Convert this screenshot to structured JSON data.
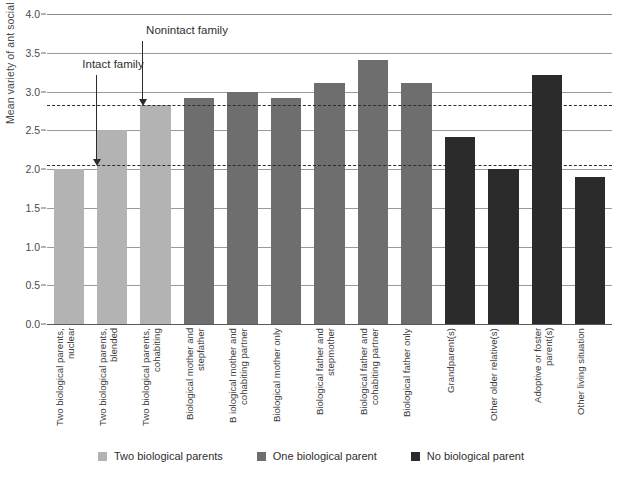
{
  "chart_data": {
    "type": "bar",
    "title": "",
    "xlabel": "",
    "ylabel": "Mean variety of ant social behavior",
    "ylim": [
      0.0,
      4.0
    ],
    "ytick_values": [
      0.0,
      0.5,
      1.0,
      1.5,
      2.0,
      2.5,
      3.0,
      3.5,
      4.0
    ],
    "ytick_labels": [
      "0.0",
      "0.5",
      "1.0",
      "1.5",
      "2.0",
      "2.5",
      "3.0",
      "3.5",
      "4.0"
    ],
    "grid": "horizontal",
    "legend_position": "bottom-center",
    "categories": [
      "Two biological parents, nuclear",
      "Two biological parents, blended",
      "Two biological parents, cohabiting",
      "Biological mother and stepfather",
      "B iological mother and cohabiting partner",
      "Biological mother only",
      "Biological father and stepmother",
      "Biological father and cohabiting partner",
      "Biological father only",
      "Grandparent(s)",
      "Other older relative(s)",
      "Adoptive or foster parent(s)",
      "Other living situation"
    ],
    "values": [
      2.0,
      2.5,
      2.83,
      2.91,
      3.0,
      2.91,
      3.11,
      3.41,
      3.11,
      2.41,
      2.0,
      3.21,
      1.9
    ],
    "groups": [
      "Two biological parents",
      "Two biological parents",
      "Two biological parents",
      "One biological parent",
      "One biological parent",
      "One biological parent",
      "One biological parent",
      "One biological parent",
      "One biological parent",
      "No biological parent",
      "No biological parent",
      "No biological parent",
      "No biological parent"
    ],
    "series": [
      {
        "name": "Two biological parents",
        "color": "#b3b3b3",
        "points": [
          {
            "category": "Two biological parents, nuclear",
            "value": 2.0
          },
          {
            "category": "Two biological parents, blended",
            "value": 2.5
          },
          {
            "category": "Two biological parents, cohabiting",
            "value": 2.83
          }
        ]
      },
      {
        "name": "One biological parent",
        "color": "#6e6e6e",
        "points": [
          {
            "category": "Biological mother and stepfather",
            "value": 2.91
          },
          {
            "category": "B iological mother and cohabiting partner",
            "value": 3.0
          },
          {
            "category": "Biological mother only",
            "value": 2.91
          },
          {
            "category": "Biological father and stepmother",
            "value": 3.11
          },
          {
            "category": "Biological father and cohabiting partner",
            "value": 3.41
          },
          {
            "category": "Biological father only",
            "value": 3.11
          }
        ]
      },
      {
        "name": "No biological parent",
        "color": "#2b2b2b",
        "points": [
          {
            "category": "Grandparent(s)",
            "value": 2.41
          },
          {
            "category": "Other older relative(s)",
            "value": 2.0
          },
          {
            "category": "Adoptive or foster parent(s)",
            "value": 3.21
          },
          {
            "category": "Other living situation",
            "value": 1.9
          }
        ]
      }
    ],
    "reference_lines": [
      {
        "label": "Nonintact family",
        "value": 2.83,
        "style": "dashed"
      },
      {
        "label": "Intact family",
        "value": 2.05,
        "style": "dashed"
      }
    ],
    "annotations": [
      {
        "text": "Nonintact family",
        "target_value": 2.83
      },
      {
        "text": "Intact family",
        "target_value": 2.05
      }
    ]
  },
  "legend": {
    "items": [
      {
        "label": "Two biological parents",
        "color": "#b3b3b3"
      },
      {
        "label": "One biological parent",
        "color": "#6e6e6e"
      },
      {
        "label": "No biological parent",
        "color": "#2b2b2b"
      }
    ]
  },
  "colors": {
    "two_biological_parents": "#b3b3b3",
    "one_biological_parent": "#6e6e6e",
    "no_biological_parent": "#2b2b2b",
    "gridline": "#8b8b8b",
    "reference_line": "#2d2d2d",
    "text": "#3a3a3a"
  }
}
